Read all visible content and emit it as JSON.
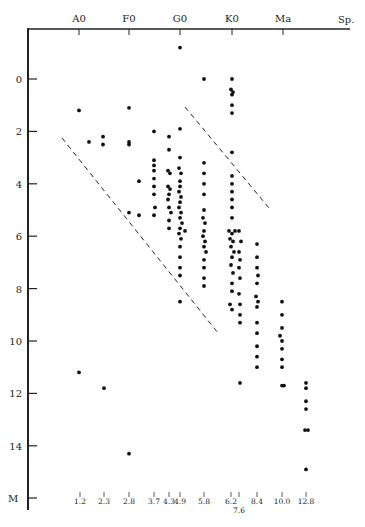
{
  "chart_data": {
    "type": "scatter",
    "title": "",
    "xlabel": "Sp.",
    "ylabel": "M",
    "top_axis": {
      "label": "Sp.",
      "ticks": [
        {
          "label": "A0",
          "x": 79
        },
        {
          "label": "F0",
          "x": 129
        },
        {
          "label": "G0",
          "x": 180
        },
        {
          "label": "K0",
          "x": 232
        },
        {
          "label": "Ma",
          "x": 283
        }
      ]
    },
    "left_axis": {
      "label": "M",
      "ylim": [
        -1.5,
        16
      ],
      "ticks": [
        0,
        2,
        4,
        6,
        8,
        10,
        12,
        14
      ]
    },
    "bottom_ticks": [
      {
        "label": "1.2",
        "x": 80,
        "row": 0
      },
      {
        "label": "2.3",
        "x": 104,
        "row": 0
      },
      {
        "label": "2.8",
        "x": 129,
        "row": 0
      },
      {
        "label": "3.7",
        "x": 154,
        "row": 0
      },
      {
        "label": "4.3",
        "x": 169,
        "row": 0
      },
      {
        "label": "4.9",
        "x": 180,
        "row": 0
      },
      {
        "label": "5.8",
        "x": 204,
        "row": 0
      },
      {
        "label": "6.2",
        "x": 231,
        "row": 0
      },
      {
        "label": "7.6",
        "x": 239,
        "row": 1
      },
      {
        "label": "8.4",
        "x": 257,
        "row": 0
      },
      {
        "label": "10.0",
        "x": 282,
        "row": 0
      },
      {
        "label": "12.8",
        "x": 306,
        "row": 0
      }
    ],
    "dashed_lines": [
      {
        "name": "upper-envelope",
        "x1": 185,
        "y1": 107,
        "x2": 269,
        "y2": 208
      },
      {
        "name": "lower-envelope",
        "x1": 62,
        "y1": 138,
        "x2": 218,
        "y2": 333
      }
    ],
    "series": [
      {
        "name": "stars",
        "points": [
          [
            180,
            -1.2
          ],
          [
            79,
            1.2
          ],
          [
            129,
            1.1
          ],
          [
            89,
            2.4
          ],
          [
            103,
            2.2
          ],
          [
            103,
            2.5
          ],
          [
            129,
            2.4
          ],
          [
            129,
            2.5
          ],
          [
            139,
            3.9
          ],
          [
            129,
            5.1
          ],
          [
            139,
            5.2
          ],
          [
            79,
            11.2
          ],
          [
            104,
            11.8
          ],
          [
            129,
            14.3
          ],
          [
            154,
            2.0
          ],
          [
            154,
            3.1
          ],
          [
            154,
            3.3
          ],
          [
            154,
            3.5
          ],
          [
            154,
            3.8
          ],
          [
            154,
            4.1
          ],
          [
            154,
            4.4
          ],
          [
            155,
            4.9
          ],
          [
            154,
            5.2
          ],
          [
            169,
            2.2
          ],
          [
            169,
            2.7
          ],
          [
            168,
            3.5
          ],
          [
            170,
            3.6
          ],
          [
            168,
            4.1
          ],
          [
            170,
            4.2
          ],
          [
            169,
            4.4
          ],
          [
            168,
            4.6
          ],
          [
            169,
            4.9
          ],
          [
            171,
            5.1
          ],
          [
            169,
            5.4
          ],
          [
            169,
            5.7
          ],
          [
            180,
            1.9
          ],
          [
            180,
            3.0
          ],
          [
            179,
            3.4
          ],
          [
            181,
            3.6
          ],
          [
            180,
            3.9
          ],
          [
            180,
            4.1
          ],
          [
            179,
            4.3
          ],
          [
            181,
            4.5
          ],
          [
            180,
            4.7
          ],
          [
            179,
            4.9
          ],
          [
            181,
            5.1
          ],
          [
            180,
            5.3
          ],
          [
            182,
            5.5
          ],
          [
            180,
            5.7
          ],
          [
            179,
            5.9
          ],
          [
            181,
            6.1
          ],
          [
            180,
            6.4
          ],
          [
            180,
            6.8
          ],
          [
            180,
            7.2
          ],
          [
            180,
            7.5
          ],
          [
            180,
            8.5
          ],
          [
            185,
            5.8
          ],
          [
            204,
            0.0
          ],
          [
            204,
            3.2
          ],
          [
            204,
            3.6
          ],
          [
            204,
            4.0
          ],
          [
            204,
            4.4
          ],
          [
            204,
            5.0
          ],
          [
            203,
            5.3
          ],
          [
            205,
            5.5
          ],
          [
            204,
            5.8
          ],
          [
            203,
            6.0
          ],
          [
            205,
            6.2
          ],
          [
            204,
            6.4
          ],
          [
            206,
            6.6
          ],
          [
            204,
            6.9
          ],
          [
            204,
            7.2
          ],
          [
            204,
            7.6
          ],
          [
            204,
            7.9
          ],
          [
            232,
            0.0
          ],
          [
            231,
            0.4
          ],
          [
            233,
            0.5
          ],
          [
            232,
            0.6
          ],
          [
            232,
            1.0
          ],
          [
            232,
            1.3
          ],
          [
            232,
            2.8
          ],
          [
            232,
            3.7
          ],
          [
            232,
            4.0
          ],
          [
            232,
            4.3
          ],
          [
            232,
            4.6
          ],
          [
            232,
            4.9
          ],
          [
            232,
            5.3
          ],
          [
            229,
            5.8
          ],
          [
            232,
            5.9
          ],
          [
            235,
            5.8
          ],
          [
            230,
            6.1
          ],
          [
            233,
            6.2
          ],
          [
            231,
            6.4
          ],
          [
            234,
            6.6
          ],
          [
            232,
            6.8
          ],
          [
            231,
            7.1
          ],
          [
            233,
            7.4
          ],
          [
            232,
            7.8
          ],
          [
            232,
            8.1
          ],
          [
            230,
            8.6
          ],
          [
            232,
            8.8
          ],
          [
            239,
            5.8
          ],
          [
            241,
            6.2
          ],
          [
            239,
            6.6
          ],
          [
            240,
            6.9
          ],
          [
            239,
            7.2
          ],
          [
            240,
            7.6
          ],
          [
            239,
            8.2
          ],
          [
            240,
            8.6
          ],
          [
            240,
            9.0
          ],
          [
            240,
            9.3
          ],
          [
            240,
            11.6
          ],
          [
            257,
            6.3
          ],
          [
            257,
            6.8
          ],
          [
            257,
            7.2
          ],
          [
            258,
            7.5
          ],
          [
            257,
            7.8
          ],
          [
            256,
            8.3
          ],
          [
            258,
            8.5
          ],
          [
            257,
            8.7
          ],
          [
            257,
            9.3
          ],
          [
            257,
            9.7
          ],
          [
            257,
            10.2
          ],
          [
            257,
            10.6
          ],
          [
            257,
            11.0
          ],
          [
            282,
            8.5
          ],
          [
            282,
            9.0
          ],
          [
            282,
            9.5
          ],
          [
            280,
            9.8
          ],
          [
            282,
            10.0
          ],
          [
            282,
            10.3
          ],
          [
            282,
            10.7
          ],
          [
            282,
            11.0
          ],
          [
            282,
            11.7
          ],
          [
            284,
            11.7
          ],
          [
            306,
            11.6
          ],
          [
            306,
            11.8
          ],
          [
            306,
            12.3
          ],
          [
            306,
            12.6
          ],
          [
            305,
            13.4
          ],
          [
            308,
            13.4
          ],
          [
            306,
            14.9
          ]
        ]
      }
    ],
    "grid": false,
    "legend": null
  }
}
